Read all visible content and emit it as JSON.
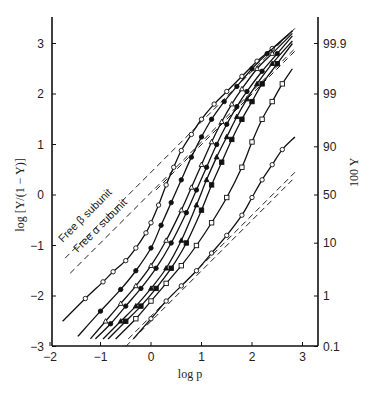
{
  "chart_data": {
    "type": "line",
    "title": "",
    "xlabel": "log p",
    "ylabel": "log [Y/(1 − Y)]",
    "ylabel_right": "100 Y",
    "xlim": [
      -2,
      3.3
    ],
    "ylim": [
      -3,
      3.5
    ],
    "x_ticks": [
      "−2",
      "−1",
      "0",
      "1",
      "2",
      "3"
    ],
    "x_tick_values": [
      -2,
      -1,
      0,
      1,
      2,
      3
    ],
    "y_ticks": [
      "−3",
      "−2",
      "−1",
      "0",
      "1",
      "2",
      "3"
    ],
    "y_tick_values": [
      -3,
      -2,
      -1,
      0,
      1,
      2,
      3
    ],
    "y_right_ticks": [
      "0.1",
      "1",
      "10",
      "50",
      "90",
      "99",
      "99.9"
    ],
    "y_right_tick_values": [
      -3,
      -2,
      -0.954,
      0,
      0.954,
      2,
      3
    ],
    "grid": false,
    "annotations": [
      {
        "text": "Free β subunit",
        "x": -1.75,
        "y": -0.95,
        "angle": -45
      },
      {
        "text": "Free α subunit",
        "x": -1.45,
        "y": -1.15,
        "angle": -45
      }
    ],
    "reference_lines": [
      {
        "name": "Free β subunit",
        "style": "dashed",
        "x": [
          -1.7,
          2.85
        ],
        "y": [
          -1.25,
          3.3
        ]
      },
      {
        "name": "Free α subunit",
        "style": "dashed",
        "x": [
          -1.6,
          2.85
        ],
        "y": [
          -1.55,
          2.9
        ]
      },
      {
        "name": "High-affinity asymptote",
        "style": "dashed",
        "x": [
          0.1,
          2.85
        ],
        "y": [
          0.1,
          2.85
        ]
      },
      {
        "name": "Low-affinity asymptote (upper)",
        "style": "dashed",
        "x": [
          -0.45,
          2.85
        ],
        "y": [
          -2.85,
          0.45
        ]
      },
      {
        "name": "Low-affinity asymptote (lower)",
        "style": "dashed",
        "x": [
          -0.5,
          2.8
        ],
        "y": [
          -3.0,
          0.3
        ]
      }
    ],
    "series": [
      {
        "name": "Curve 1",
        "marker": "open-circle",
        "x": [
          -1.75,
          -1.3,
          -0.95,
          -0.75,
          -0.5,
          -0.3,
          -0.1,
          0.0,
          0.15,
          0.3,
          0.45,
          0.6,
          0.8,
          1.0,
          1.25,
          1.5,
          1.8,
          2.1,
          2.4,
          2.8
        ],
        "y": [
          -2.5,
          -2.05,
          -1.72,
          -1.52,
          -1.3,
          -1.05,
          -0.75,
          -0.55,
          -0.2,
          0.2,
          0.55,
          0.88,
          1.2,
          1.5,
          1.8,
          2.05,
          2.35,
          2.65,
          2.9,
          3.25
        ]
      },
      {
        "name": "Curve 2",
        "marker": "filled-circle",
        "x": [
          -1.45,
          -1.0,
          -0.6,
          -0.3,
          0.0,
          0.2,
          0.4,
          0.6,
          0.8,
          1.0,
          1.2,
          1.45,
          1.7,
          2.0,
          2.3,
          2.8
        ],
        "y": [
          -2.8,
          -2.3,
          -1.87,
          -1.5,
          -1.05,
          -0.6,
          -0.15,
          0.3,
          0.75,
          1.15,
          1.5,
          1.85,
          2.15,
          2.5,
          2.8,
          3.25
        ]
      },
      {
        "name": "Curve 3",
        "marker": "open-triangle",
        "x": [
          -1.2,
          -0.9,
          -0.6,
          -0.3,
          0.0,
          0.3,
          0.6,
          0.8,
          1.0,
          1.2,
          1.4,
          1.6,
          1.8,
          2.1,
          2.4,
          2.8
        ],
        "y": [
          -2.85,
          -2.5,
          -2.15,
          -1.8,
          -1.4,
          -0.9,
          -0.3,
          0.15,
          0.6,
          1.05,
          1.45,
          1.8,
          2.1,
          2.5,
          2.8,
          3.2
        ]
      },
      {
        "name": "Curve 4",
        "marker": "filled-circle",
        "x": [
          -1.1,
          -0.8,
          -0.5,
          -0.2,
          0.1,
          0.4,
          0.7,
          0.9,
          1.1,
          1.3,
          1.5,
          1.7,
          1.9,
          2.2,
          2.5,
          2.8
        ],
        "y": [
          -2.85,
          -2.55,
          -2.2,
          -1.85,
          -1.45,
          -0.95,
          -0.35,
          0.1,
          0.55,
          1.0,
          1.4,
          1.75,
          2.05,
          2.45,
          2.8,
          3.15
        ]
      },
      {
        "name": "Curve 5",
        "marker": "filled-triangle",
        "x": [
          -0.95,
          -0.6,
          -0.3,
          0.0,
          0.3,
          0.6,
          0.9,
          1.1,
          1.3,
          1.5,
          1.7,
          1.9,
          2.1,
          2.4,
          2.8
        ],
        "y": [
          -2.85,
          -2.5,
          -2.2,
          -1.85,
          -1.45,
          -0.9,
          -0.2,
          0.3,
          0.75,
          1.15,
          1.55,
          1.9,
          2.2,
          2.6,
          3.05
        ]
      },
      {
        "name": "Curve 6",
        "marker": "filled-square",
        "x": [
          -0.85,
          -0.5,
          -0.2,
          0.1,
          0.4,
          0.7,
          1.0,
          1.2,
          1.4,
          1.6,
          1.8,
          2.0,
          2.2,
          2.5,
          2.8
        ],
        "y": [
          -2.85,
          -2.5,
          -2.2,
          -1.85,
          -1.45,
          -0.95,
          -0.3,
          0.2,
          0.65,
          1.1,
          1.5,
          1.85,
          2.2,
          2.6,
          3.0
        ]
      },
      {
        "name": "Curve 7",
        "marker": "open-square",
        "x": [
          -0.7,
          -0.3,
          0.0,
          0.3,
          0.6,
          0.9,
          1.2,
          1.5,
          1.8,
          2.0,
          2.2,
          2.4,
          2.6,
          2.8
        ],
        "y": [
          -2.85,
          -2.45,
          -2.1,
          -1.75,
          -1.4,
          -1.0,
          -0.55,
          -0.05,
          0.55,
          1.05,
          1.5,
          1.85,
          2.2,
          2.5
        ]
      },
      {
        "name": "Curve 8",
        "marker": "open-circle",
        "x": [
          -0.35,
          0.0,
          0.3,
          0.6,
          0.9,
          1.2,
          1.5,
          1.8,
          2.0,
          2.2,
          2.4,
          2.6,
          2.85
        ],
        "y": [
          -2.85,
          -2.45,
          -2.1,
          -1.8,
          -1.5,
          -1.15,
          -0.8,
          -0.4,
          -0.05,
          0.3,
          0.6,
          0.9,
          1.15
        ]
      }
    ]
  }
}
